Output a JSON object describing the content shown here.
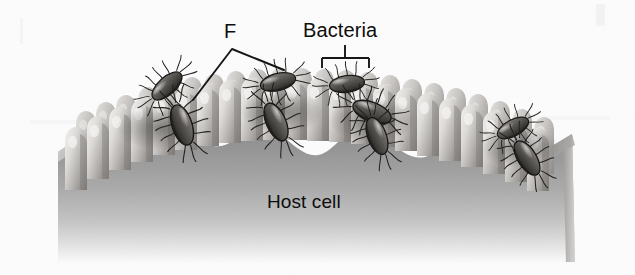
{
  "figure": {
    "background_color": "#fdfdfd",
    "labels": {
      "fimbriae": "F",
      "bacteria": "Bacteria",
      "host_cell": "Host cell"
    },
    "colors": {
      "label_text": "#0d0d0d",
      "leader_line": "#111111",
      "cell_body_top": "#8e8e8e",
      "cell_body_bottom": "#f2f2f2",
      "microvilli_light": "#e6e4e2",
      "microvilli_mid": "#b9b6b3",
      "microvilli_shadow": "#6f6d6b",
      "bacteria_body": "#5a5855",
      "bacteria_highlight": "#b3b0ad",
      "bacteria_outline": "#1b1b1b"
    },
    "annotations": {
      "fimbriae_leader": {
        "apex": [
          232,
          49
        ],
        "left_end": [
          193,
          100
        ],
        "right_end": [
          284,
          70
        ]
      },
      "bacteria_bracket": {
        "stem_top": [
          345,
          45
        ],
        "stem_bottom": [
          345,
          58
        ],
        "bar_left": [
          322,
          58
        ],
        "bar_right": [
          369,
          58
        ],
        "tick_depth": 10
      }
    },
    "bacteria_count": 8,
    "microvilli_count": 22
  }
}
